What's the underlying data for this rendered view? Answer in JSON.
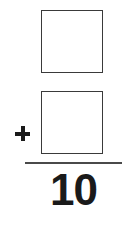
{
  "problem": {
    "operator": "+",
    "addend_1": "",
    "addend_2": "",
    "sum": "10"
  },
  "colors": {
    "ink": "#1a1a1a",
    "box_border": "#3a3a3a",
    "background": "#ffffff"
  }
}
